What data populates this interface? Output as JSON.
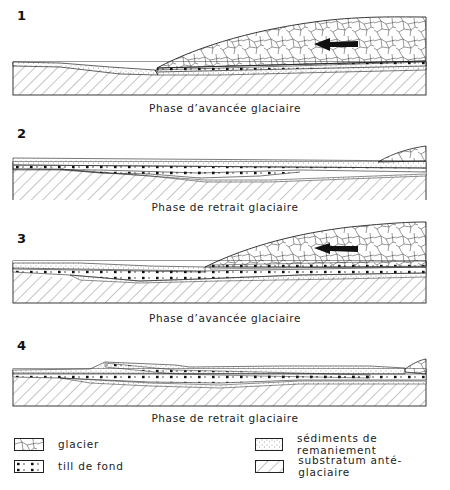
{
  "figure": {
    "panels": [
      {
        "number": "1",
        "caption": "Phase d’avancée glaciaire",
        "phase": "advance",
        "flow_arrow": "arrow-left"
      },
      {
        "number": "2",
        "caption": "Phase de retrait glaciaire",
        "phase": "retreat"
      },
      {
        "number": "3",
        "caption": "Phase d’avancée glaciaire",
        "phase": "advance",
        "flow_arrow": "arrow-left"
      },
      {
        "number": "4",
        "caption": "Phase de retrait glaciaire",
        "phase": "retreat"
      }
    ],
    "legend": [
      {
        "pattern": "glacier-crackle-pattern",
        "label": "glacier"
      },
      {
        "pattern": "stipple-pattern",
        "label": "sédiments de remaniement"
      },
      {
        "pattern": "dotted-dash-pattern",
        "label": "till de fond"
      },
      {
        "pattern": "diagonal-hatch-pattern",
        "label": "substratum anté-glaciaire"
      }
    ]
  },
  "colors": {
    "ink": "#222222",
    "background": "#ffffff"
  }
}
